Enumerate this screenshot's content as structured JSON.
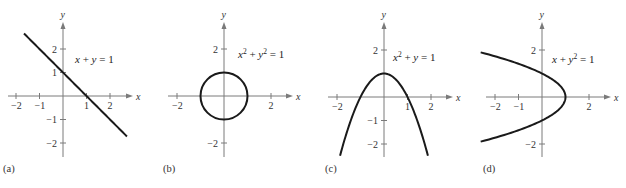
{
  "chart_data": [
    {
      "type": "line",
      "id": "a",
      "panel_label": "(a)",
      "equation": {
        "parts": [
          [
            "x",
            "it"
          ],
          [
            " + ",
            ""
          ],
          [
            "y",
            "it"
          ],
          [
            " = 1",
            ""
          ]
        ]
      },
      "equation_text": "x + y = 1",
      "xlabel": "x",
      "ylabel": "y",
      "xticks": [
        -2,
        -1,
        1,
        2
      ],
      "xtick_labels": [
        "−2",
        "−1",
        "1",
        "2"
      ],
      "yticks": [
        2,
        1,
        -1,
        -2
      ],
      "ytick_labels": [
        "2",
        "1",
        "−1",
        "−2"
      ],
      "xlim": [
        -2.4,
        2.9
      ],
      "ylim": [
        -2.6,
        2.9
      ],
      "curve": {
        "kind": "function_of_x",
        "expr": "1 - x",
        "domain": [
          -1.66,
          2.72
        ]
      }
    },
    {
      "type": "line",
      "id": "b",
      "panel_label": "(b)",
      "equation": {
        "parts": [
          [
            "x",
            "it"
          ],
          [
            "2",
            "sup"
          ],
          [
            " + ",
            ""
          ],
          [
            "y",
            "it"
          ],
          [
            "2",
            "sup"
          ],
          [
            " = 1",
            ""
          ]
        ]
      },
      "equation_text": "x² + y² = 1",
      "xlabel": "x",
      "ylabel": "y",
      "xticks": [
        -2,
        2
      ],
      "xtick_labels": [
        "−2",
        "2"
      ],
      "yticks": [
        2,
        -2
      ],
      "ytick_labels": [
        "2",
        "−2"
      ],
      "xlim": [
        -2.4,
        2.9
      ],
      "ylim": [
        -2.6,
        2.9
      ],
      "curve": {
        "kind": "circle",
        "center": [
          0,
          0
        ],
        "radius": 1
      }
    },
    {
      "type": "line",
      "id": "c",
      "panel_label": "(c)",
      "equation": {
        "parts": [
          [
            "x",
            "it"
          ],
          [
            "2",
            "sup"
          ],
          [
            " + ",
            ""
          ],
          [
            "y",
            "it"
          ],
          [
            " = 1",
            ""
          ]
        ]
      },
      "equation_text": "x² + y = 1",
      "xlabel": "x",
      "ylabel": "y",
      "xticks": [
        -2,
        1,
        2
      ],
      "xtick_labels": [
        "−2",
        "1",
        "2"
      ],
      "yticks": [
        2,
        -1,
        -2
      ],
      "ytick_labels": [
        "2",
        "−1",
        "−2"
      ],
      "xlim": [
        -2.4,
        2.9
      ],
      "ylim": [
        -2.6,
        2.9
      ],
      "curve": {
        "kind": "function_of_x",
        "expr": "1 - x*x",
        "domain": [
          -1.87,
          1.87
        ]
      }
    },
    {
      "type": "line",
      "id": "d",
      "panel_label": "(d)",
      "equation": {
        "parts": [
          [
            "x",
            "it"
          ],
          [
            " + ",
            ""
          ],
          [
            "y",
            "it"
          ],
          [
            "2",
            "sup"
          ],
          [
            " = 1",
            ""
          ]
        ]
      },
      "equation_text": "x + y² = 1",
      "xlabel": "x",
      "ylabel": "y",
      "xticks": [
        -2,
        -1,
        2
      ],
      "xtick_labels": [
        "−2",
        "−1",
        "2"
      ],
      "yticks": [
        2,
        -2
      ],
      "ytick_labels": [
        "2",
        "−2"
      ],
      "xlim": [
        -2.4,
        2.9
      ],
      "ylim": [
        -2.6,
        2.9
      ],
      "curve": {
        "kind": "function_of_y",
        "expr": "1 - y*y",
        "domain": [
          -1.9,
          1.9
        ]
      }
    }
  ]
}
